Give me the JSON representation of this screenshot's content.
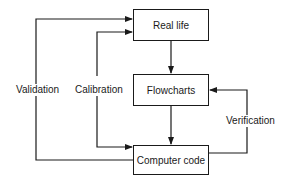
{
  "diagram": {
    "type": "flowchart",
    "nodes": [
      {
        "id": "real_life",
        "label": "Real life"
      },
      {
        "id": "flowcharts",
        "label": "Flowcharts"
      },
      {
        "id": "computer_code",
        "label": "Computer code"
      }
    ],
    "edges": [
      {
        "from": "real_life",
        "to": "flowcharts",
        "label": ""
      },
      {
        "from": "flowcharts",
        "to": "computer_code",
        "label": ""
      },
      {
        "from": "computer_code",
        "to": "flowcharts",
        "label": "Verification"
      },
      {
        "from": "real_life",
        "to": "computer_code",
        "label": "Calibration"
      },
      {
        "from": "computer_code",
        "to": "real_life",
        "label": "Validation"
      }
    ],
    "labels": {
      "validation": "Validation",
      "calibration": "Calibration",
      "verification": "Verification"
    },
    "colors": {
      "stroke": "#1a1a1a",
      "background": "#ffffff"
    }
  }
}
